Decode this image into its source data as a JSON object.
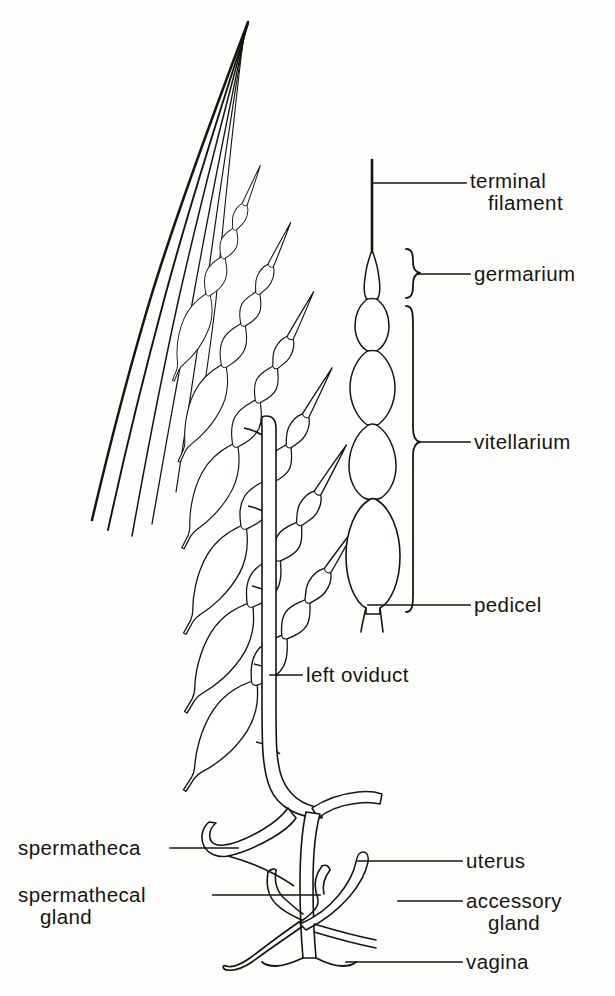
{
  "figure": {
    "kind": "scientific-line-drawing",
    "background_color": "#fdfdfc",
    "ink_color": "#17140f"
  },
  "labels": {
    "terminal_filament": {
      "line1": "terminal",
      "line2": "filament"
    },
    "germarium": {
      "line1": "germarium"
    },
    "vitellarium": {
      "line1": "vitellarium"
    },
    "pedicel": {
      "line1": "pedicel"
    },
    "left_oviduct": {
      "line1": "left oviduct"
    },
    "spermatheca": {
      "line1": "spermatheca"
    },
    "spermathecal_gland": {
      "line1": "spermathecal",
      "line2": "gland"
    },
    "uterus": {
      "line1": "uterus"
    },
    "accessory_gland": {
      "line1": "accessory",
      "line2": "gland"
    },
    "vagina": {
      "line1": "vagina"
    }
  },
  "structures": {
    "ovary": {
      "name": "left ovary",
      "ovariole_count": 6
    },
    "detail_ovariole": {
      "name": "isolated ovariole",
      "follicle_count": 4
    },
    "genital_chamber": {
      "name": "genital chamber"
    }
  },
  "brackets": [
    {
      "name": "germarium-bracket",
      "top": 248,
      "bottom": 300
    },
    {
      "name": "vitellarium-bracket",
      "top": 306,
      "bottom": 612
    }
  ]
}
